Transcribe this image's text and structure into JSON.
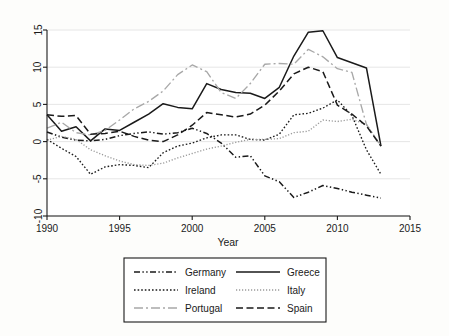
{
  "chart_data": {
    "type": "line",
    "title": "",
    "xlabel": "Year",
    "ylabel": "",
    "xlim": [
      1990,
      2015
    ],
    "ylim": [
      -10,
      15
    ],
    "xticks": [
      1990,
      1995,
      2000,
      2005,
      2010,
      2015
    ],
    "yticks": [
      15,
      10,
      5,
      0,
      -5,
      -10
    ],
    "grid": "horizontal",
    "legend_position": "below-plot",
    "legend_columns": 2,
    "x": [
      1990,
      1991,
      1992,
      1993,
      1994,
      1995,
      1996,
      1997,
      1998,
      1999,
      2000,
      2001,
      2002,
      2003,
      2004,
      2005,
      2006,
      2007,
      2008,
      2009,
      2010,
      2011,
      2012,
      2013
    ],
    "series": [
      {
        "name": "Germany",
        "style": "dash-dot-dot",
        "color": "#1a1a1a",
        "values": [
          1.3,
          0.6,
          0.2,
          0.1,
          0.3,
          0.8,
          1.1,
          1.3,
          1.0,
          1.2,
          1.8,
          1.1,
          -0.2,
          -2.1,
          -1.9,
          -4.6,
          -5.4,
          -7.5,
          -6.8,
          -5.9,
          -6.3,
          -6.8,
          -7.2,
          -7.6
        ]
      },
      {
        "name": "Greece",
        "style": "solid",
        "color": "#1a1a1a",
        "values": [
          3.6,
          1.4,
          2.0,
          0.1,
          1.7,
          1.5,
          2.6,
          3.7,
          5.1,
          4.6,
          4.4,
          7.8,
          7.0,
          6.6,
          6.5,
          5.8,
          7.3,
          11.5,
          14.7,
          14.9,
          11.3,
          10.6,
          9.9,
          -0.6
        ]
      },
      {
        "name": "Ireland",
        "style": "dotted",
        "color": "#1a1a1a",
        "values": [
          0.3,
          -0.9,
          -2.0,
          -4.4,
          -3.4,
          -3.1,
          -3.2,
          -3.5,
          -1.5,
          -0.6,
          -0.2,
          0.5,
          0.9,
          0.9,
          0.3,
          0.2,
          1.0,
          3.6,
          3.8,
          4.5,
          5.6,
          3.5,
          -1.1,
          -4.4
        ]
      },
      {
        "name": "Italy",
        "style": "fine-dotted",
        "color": "#9a9a9a",
        "values": [
          0.2,
          0.7,
          0.3,
          -1.1,
          -1.9,
          -2.6,
          -3.1,
          -3.2,
          -2.9,
          -2.2,
          -1.6,
          -1.0,
          -0.6,
          -0.1,
          0.3,
          0.3,
          0.4,
          1.2,
          1.4,
          2.9,
          2.7,
          3.0,
          2.3,
          -0.6
        ]
      },
      {
        "name": "Portugal",
        "style": "long-dash-dot",
        "color": "#a8a8a8",
        "values": [
          1.8,
          2.6,
          1.2,
          0.9,
          1.5,
          2.9,
          4.4,
          5.4,
          6.8,
          9.0,
          10.3,
          9.4,
          6.6,
          5.8,
          7.8,
          10.4,
          10.5,
          10.4,
          12.4,
          11.4,
          9.8,
          9.3,
          2.3,
          -0.6
        ]
      },
      {
        "name": "Spain",
        "style": "dashed",
        "color": "#1a1a1a",
        "values": [
          3.6,
          3.4,
          3.5,
          1.0,
          1.1,
          1.4,
          0.7,
          0.2,
          0.0,
          0.9,
          2.2,
          3.9,
          3.6,
          3.3,
          3.7,
          4.9,
          6.8,
          9.1,
          10.0,
          9.4,
          4.9,
          3.7,
          2.1,
          -0.6
        ]
      }
    ]
  },
  "axis": {
    "x_title": "Year",
    "x_tick_labels": [
      "1990",
      "1995",
      "2000",
      "2005",
      "2010",
      "2015"
    ],
    "y_tick_labels": [
      "15",
      "10",
      "5",
      "0",
      "-5",
      "-10"
    ]
  },
  "legend": {
    "entries": [
      {
        "label": "Germany",
        "col": 0,
        "row": 0
      },
      {
        "label": "Greece",
        "col": 1,
        "row": 0
      },
      {
        "label": "Ireland",
        "col": 0,
        "row": 1
      },
      {
        "label": "Italy",
        "col": 1,
        "row": 1
      },
      {
        "label": "Portugal",
        "col": 0,
        "row": 2
      },
      {
        "label": "Spain",
        "col": 1,
        "row": 2
      }
    ]
  },
  "colors": {
    "background": "#fdfdfb",
    "plot_background": "#ffffff",
    "gridline": "#e3e3e3",
    "axis": "#1a1a1a",
    "series_black": "#1a1a1a",
    "series_gray": "#9a9a9a",
    "series_gray_light": "#a8a8a8"
  }
}
